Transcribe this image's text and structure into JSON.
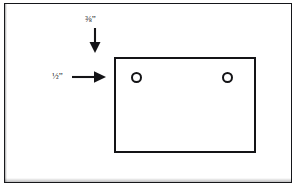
{
  "diagram": {
    "background_color": "#ffffff",
    "line_color": "#141417",
    "outer_frame": {
      "name": "outer border",
      "x": 4,
      "y": 3,
      "width": 288,
      "height": 180
    },
    "workpiece": {
      "name": "panel outline",
      "x": 114,
      "y": 57,
      "width": 142,
      "height": 96
    },
    "holes": [
      {
        "label": "left hole",
        "cx": 136,
        "cy": 77,
        "diameter": 11
      },
      {
        "label": "right hole",
        "cx": 227,
        "cy": 77,
        "diameter": 11
      }
    ],
    "dimensions": [
      {
        "id": "top-dimension",
        "text": "⅜”",
        "numerator": "3",
        "denominator": "8",
        "unit": "inch",
        "value": 0.375,
        "arrow_direction": "down",
        "arrow_from": {
          "x": 95,
          "y": 28
        },
        "arrow_to": {
          "x": 95,
          "y": 52
        }
      },
      {
        "id": "left-dimension",
        "text": "½”",
        "numerator": "1",
        "denominator": "2",
        "unit": "inch",
        "value": 0.5,
        "arrow_direction": "right",
        "arrow_from": {
          "x": 72,
          "y": 77
        },
        "arrow_to": {
          "x": 106,
          "y": 77
        }
      }
    ]
  }
}
